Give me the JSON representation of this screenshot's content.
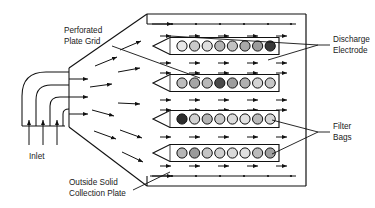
{
  "diagram": {
    "type": "engineering-schematic",
    "canvas": {
      "width": 375,
      "height": 208
    },
    "stroke_color": "#111111",
    "background_color": "#ffffff"
  },
  "labels": {
    "perforated_plate_grid": {
      "line1": "Perforated",
      "line2": "Plate Grid"
    },
    "inlet": {
      "line1": "Inlet"
    },
    "outside_solid_collection_plate": {
      "line1": "Outside Solid",
      "line2": "Collection Plate"
    },
    "discharge_electrode": {
      "line1": "Discharge",
      "line2": "Electrode"
    },
    "filter_bags": {
      "line1": "Filter",
      "line2": "Bags"
    }
  },
  "inlet": {
    "arrow_count_bottom": 3,
    "arrow_count_right": 3,
    "duct_shape": "curved-elbow"
  },
  "plenum": {
    "shape": "trapezoid-expansion",
    "flow_arrow_count": 9
  },
  "housing": {
    "left_wall_x": 147,
    "right_wall_x": 306,
    "top_y": 14,
    "bottom_y": 186
  },
  "electrodes": {
    "top": {
      "tick_count": 6,
      "y": 26
    },
    "bottom": {
      "tick_count": 6,
      "y": 175
    }
  },
  "bag_rows": [
    {
      "id": "row-1",
      "y": 46,
      "bag_count": 8,
      "bag_shades": [
        "#e8e8e8",
        "#c9c9c9",
        "#dedede",
        "#b3b3b3",
        "#c2c2c2",
        "#a8a8a8",
        "#9c9c9c",
        "#3a3a3a"
      ]
    },
    {
      "id": "row-2",
      "y": 83,
      "bag_count": 8,
      "bag_shades": [
        "#bdbdbd",
        "#a5a5a5",
        "#b8b8b8",
        "#4a4a4a",
        "#9e9e9e",
        "#b0b0b0",
        "#d4d4d4",
        "#c6c6c6"
      ]
    },
    {
      "id": "row-3",
      "y": 119,
      "bag_count": 8,
      "bag_shades": [
        "#2e2e2e",
        "#d2d2d2",
        "#b4b4b4",
        "#c8c8c8",
        "#dcdcdc",
        "#e2e2e2",
        "#b9b9b9",
        "#d8d8d8"
      ]
    },
    {
      "id": "row-4",
      "y": 153,
      "bag_count": 8,
      "bag_shades": [
        "#b6b6b6",
        "#9a9a9a",
        "#c4c4c4",
        "#cfcfcf",
        "#dadada",
        "#e0e0e0",
        "#bbbbbb",
        "#a0a0a0"
      ]
    }
  ],
  "interior_arrow_rows": [
    {
      "y": 36,
      "count": 5
    },
    {
      "y": 63,
      "count": 5
    },
    {
      "y": 73,
      "count": 5
    },
    {
      "y": 100,
      "count": 5
    },
    {
      "y": 110,
      "count": 5
    },
    {
      "y": 137,
      "count": 5
    },
    {
      "y": 166,
      "count": 5
    }
  ]
}
